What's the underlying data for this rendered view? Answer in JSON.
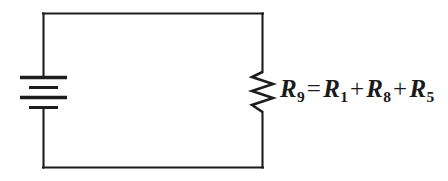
{
  "diagram": {
    "background_color": "#ffffff",
    "line_color": "#1d1d1d",
    "text_color": "#1a1a1a",
    "components": [
      {
        "name": "battery",
        "symbol": "battery-cells",
        "cells": 2,
        "plates": [
          "long",
          "short",
          "long",
          "short"
        ],
        "position": "left-rail"
      },
      {
        "name": "resistor",
        "symbol": "resistor-zigzag",
        "peaks": 5,
        "position": "right-rail",
        "label": "R9"
      },
      {
        "name": "wire-loop",
        "symbol": "closed-rectangular-loop"
      }
    ],
    "equation": {
      "lhs_var": "R",
      "lhs_sub": "9",
      "equals": "=",
      "terms": [
        {
          "var": "R",
          "sub": "1"
        },
        {
          "var": "R",
          "sub": "8"
        },
        {
          "var": "R",
          "sub": "5"
        }
      ],
      "plus": "+",
      "plain_text": "R9 = R1 + R8 + R5"
    }
  }
}
